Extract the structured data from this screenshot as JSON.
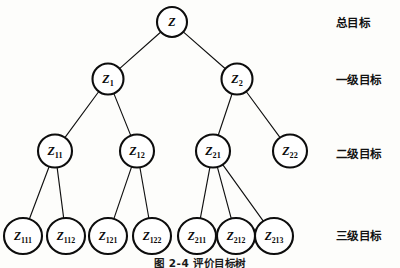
{
  "figure": {
    "caption": "图 2-4  评价目标树",
    "background_color": "#fdfdfb",
    "stroke_color": "#0d0d0d"
  },
  "level_labels": [
    {
      "text": "总目标",
      "y": 22
    },
    {
      "text": "一级目标",
      "y": 79
    },
    {
      "text": "二级目标",
      "y": 153
    },
    {
      "text": "三级目标",
      "y": 235
    }
  ],
  "nodes": [
    {
      "id": "Z",
      "base": "Z",
      "sub": "",
      "cx": 172,
      "cy": 22,
      "rx": 15,
      "ry": 15,
      "fs": 12,
      "level": 0
    },
    {
      "id": "Z1",
      "base": "Z",
      "sub": "1",
      "cx": 108,
      "cy": 79,
      "rx": 15.5,
      "ry": 15.5,
      "fs": 12,
      "level": 1
    },
    {
      "id": "Z2",
      "base": "Z",
      "sub": "2",
      "cx": 237,
      "cy": 79,
      "rx": 15.5,
      "ry": 15.5,
      "fs": 12,
      "level": 1
    },
    {
      "id": "Z11",
      "base": "Z",
      "sub": "11",
      "cx": 55,
      "cy": 151,
      "rx": 17,
      "ry": 16.5,
      "fs": 12,
      "level": 2
    },
    {
      "id": "Z12",
      "base": "Z",
      "sub": "12",
      "cx": 137,
      "cy": 151,
      "rx": 17,
      "ry": 16.5,
      "fs": 12,
      "level": 2
    },
    {
      "id": "Z21",
      "base": "Z",
      "sub": "21",
      "cx": 213,
      "cy": 151,
      "rx": 17,
      "ry": 16.5,
      "fs": 12,
      "level": 2
    },
    {
      "id": "Z22",
      "base": "Z",
      "sub": "22",
      "cx": 290,
      "cy": 151,
      "rx": 17,
      "ry": 16.5,
      "fs": 12,
      "level": 2
    },
    {
      "id": "Z111",
      "base": "Z",
      "sub": "111",
      "cx": 23,
      "cy": 236,
      "rx": 19,
      "ry": 18,
      "fs": 11.5,
      "level": 3
    },
    {
      "id": "Z112",
      "base": "Z",
      "sub": "112",
      "cx": 66,
      "cy": 236,
      "rx": 19,
      "ry": 18,
      "fs": 11.5,
      "level": 3
    },
    {
      "id": "Z121",
      "base": "Z",
      "sub": "121",
      "cx": 108,
      "cy": 236,
      "rx": 19,
      "ry": 18,
      "fs": 11.5,
      "level": 3
    },
    {
      "id": "Z122",
      "base": "Z",
      "sub": "122",
      "cx": 152,
      "cy": 236,
      "rx": 19,
      "ry": 18,
      "fs": 11.5,
      "level": 3
    },
    {
      "id": "Z211",
      "base": "Z",
      "sub": "211",
      "cx": 197,
      "cy": 236,
      "rx": 19,
      "ry": 18,
      "fs": 11.5,
      "level": 3
    },
    {
      "id": "Z212",
      "base": "Z",
      "sub": "212",
      "cx": 236,
      "cy": 236,
      "rx": 19,
      "ry": 18,
      "fs": 11.5,
      "level": 3
    },
    {
      "id": "Z213",
      "base": "Z",
      "sub": "213",
      "cx": 274,
      "cy": 236,
      "rx": 19,
      "ry": 18,
      "fs": 11.5,
      "level": 3
    }
  ],
  "edges": [
    {
      "from": "Z",
      "to": "Z1"
    },
    {
      "from": "Z",
      "to": "Z2"
    },
    {
      "from": "Z1",
      "to": "Z11"
    },
    {
      "from": "Z1",
      "to": "Z12"
    },
    {
      "from": "Z2",
      "to": "Z21"
    },
    {
      "from": "Z2",
      "to": "Z22"
    },
    {
      "from": "Z11",
      "to": "Z111"
    },
    {
      "from": "Z11",
      "to": "Z112"
    },
    {
      "from": "Z12",
      "to": "Z121"
    },
    {
      "from": "Z12",
      "to": "Z122"
    },
    {
      "from": "Z21",
      "to": "Z211"
    },
    {
      "from": "Z21",
      "to": "Z212"
    },
    {
      "from": "Z21",
      "to": "Z213"
    }
  ]
}
